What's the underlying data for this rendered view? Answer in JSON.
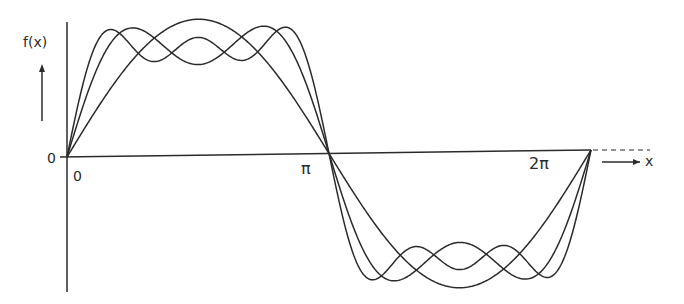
{
  "figure": {
    "y_axis_label": "f(x)",
    "x_axis_label": "x",
    "origin_label_left": "0",
    "origin_label_below": "0",
    "tick_pi": "π",
    "tick_two_pi": "2π",
    "stroke_color": "#2b2b2b",
    "background": "#ffffff"
  },
  "chart_data": {
    "type": "line",
    "title": "",
    "xlabel": "x",
    "ylabel": "f(x)",
    "x_ticks": [
      "0",
      "π",
      "2π"
    ],
    "xlim": [
      0,
      6.2832
    ],
    "grid": false,
    "legend": null,
    "series": [
      {
        "name": "1 term: (4/π) sin x",
        "terms": [
          1
        ]
      },
      {
        "name": "2 terms: (4/π)(sin x + sin 3x/3)",
        "terms": [
          1,
          3
        ]
      },
      {
        "name": "3 terms: (4/π)(sin x + sin 3x/3 + sin 5x/5)",
        "terms": [
          1,
          3,
          5
        ]
      }
    ]
  }
}
